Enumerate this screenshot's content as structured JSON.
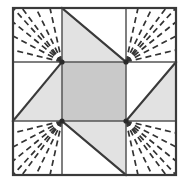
{
  "diagram": {
    "type": "quilt-block-piecing-diagram",
    "grid": {
      "rows": 3,
      "cols": 3
    },
    "frame": {
      "x": 13,
      "y": 8,
      "width": 163,
      "height": 167
    },
    "grid_lines_x": [
      13,
      62,
      126,
      176
    ],
    "grid_lines_y": [
      8,
      62,
      121,
      175
    ],
    "colors": {
      "background": "#ffffff",
      "patch_light": "#ffffff",
      "patch_medium": "#e2e2e2",
      "patch_dark": "#c9c9c9",
      "outline": "#3a3a3a",
      "seam_line": "#555555",
      "quilting_dash": "#333333"
    },
    "cells": [
      {
        "name": "top-left",
        "row": 0,
        "col": 0,
        "fill": "light",
        "shape": "square",
        "quilting": "radiating-fan",
        "fan_origin": "bottom-right"
      },
      {
        "name": "top-center",
        "row": 0,
        "col": 1,
        "fill": "medium",
        "shape": "half-square-triangle",
        "diagonal": "tl-br",
        "shaded_half": "lower-left",
        "quilting": "none"
      },
      {
        "name": "top-right",
        "row": 0,
        "col": 2,
        "fill": "light",
        "shape": "square",
        "quilting": "radiating-fan",
        "fan_origin": "bottom-left"
      },
      {
        "name": "middle-left",
        "row": 1,
        "col": 0,
        "fill": "medium",
        "shape": "half-square-triangle",
        "diagonal": "bl-tr",
        "shaded_half": "upper-right",
        "quilting": "none"
      },
      {
        "name": "center",
        "row": 1,
        "col": 1,
        "fill": "dark",
        "shape": "square",
        "quilting": "none"
      },
      {
        "name": "middle-right",
        "row": 1,
        "col": 2,
        "fill": "medium",
        "shape": "half-square-triangle",
        "diagonal": "bl-tr",
        "shaded_half": "lower-right",
        "quilting": "none"
      },
      {
        "name": "bottom-left",
        "row": 2,
        "col": 0,
        "fill": "light",
        "shape": "square",
        "quilting": "radiating-fan",
        "fan_origin": "top-right"
      },
      {
        "name": "bottom-center",
        "row": 2,
        "col": 1,
        "fill": "medium",
        "shape": "half-square-triangle",
        "diagonal": "tl-br",
        "shaded_half": "upper-right",
        "quilting": "none"
      },
      {
        "name": "bottom-right",
        "row": 2,
        "col": 2,
        "fill": "light",
        "shape": "square",
        "quilting": "radiating-fan",
        "fan_origin": "top-left"
      }
    ],
    "quilting": {
      "style": "dashed",
      "dash_pattern": "6 4",
      "rays_per_corner": 6,
      "description": "Radiating fan quilting lines emanating from the inner corner of each corner block"
    },
    "star_points": 4,
    "center_patch": "square"
  }
}
